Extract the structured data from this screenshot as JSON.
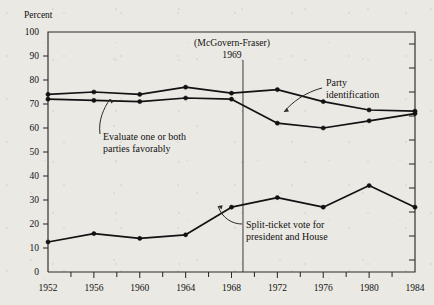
{
  "chart_data": {
    "type": "line",
    "title": "",
    "xlabel": "",
    "ylabel": "Percent",
    "xlim": [
      1952,
      1984
    ],
    "ylim": [
      0,
      100
    ],
    "grid": false,
    "legend": "annotated-inline",
    "x_ticks_major": [
      1952,
      1956,
      1960,
      1964,
      1968,
      1972,
      1976,
      1980,
      1984
    ],
    "x_tick_labels": [
      "1952",
      "1956",
      "1960",
      "1964",
      "1968",
      "1972",
      "1976",
      "1980",
      "1984"
    ],
    "x_ticks_minor": [
      1954,
      1958,
      1962,
      1966,
      1970,
      1974,
      1978,
      1982
    ],
    "y_ticks_major": [
      0,
      10,
      20,
      30,
      40,
      50,
      60,
      70,
      80,
      90,
      100
    ],
    "y_tick_labels": [
      "0",
      "10",
      "20",
      "30",
      "40",
      "50",
      "60",
      "70",
      "80",
      "90",
      "100"
    ],
    "y_ticks_minor_right": [
      5,
      15,
      25,
      35,
      45,
      55,
      65,
      75,
      85,
      95
    ],
    "x": [
      1952,
      1956,
      1960,
      1964,
      1968,
      1972,
      1976,
      1980,
      1984
    ],
    "series": [
      {
        "name": "Party identification",
        "values": [
          74,
          75,
          74,
          77,
          74.5,
          76,
          71,
          67.5,
          67
        ]
      },
      {
        "name": "Evaluate one or both parties favorably",
        "values": [
          72,
          71.5,
          71,
          72.5,
          72,
          62,
          60,
          63,
          66
        ]
      },
      {
        "name": "Split-ticket vote for president and House",
        "values": [
          12.5,
          16,
          14,
          15.5,
          27,
          31,
          27,
          36,
          27
        ]
      }
    ],
    "annotations": [
      {
        "name": "mcgovern-fraser-event",
        "line1": "(McGovern-Fraser)",
        "line2": "1969",
        "x_value": 1969
      },
      {
        "name": "party-identification-label",
        "line1": "Party",
        "line2": "identification"
      },
      {
        "name": "evaluate-parties-label",
        "line1": "Evaluate one or both",
        "line2": "parties favorably"
      },
      {
        "name": "split-ticket-label",
        "line1": "Split-ticket vote for",
        "line2": "president and House"
      }
    ],
    "colors": {
      "ink": "#121212",
      "axis": "#2b2b2b",
      "paper": "#ebe9e4"
    }
  }
}
